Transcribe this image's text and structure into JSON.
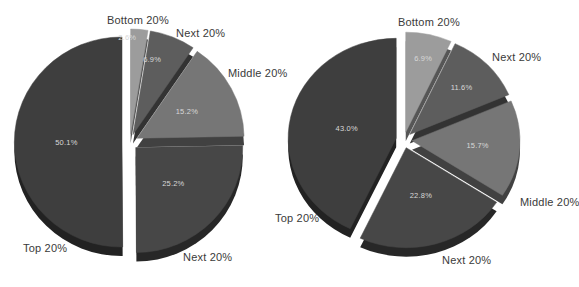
{
  "page": {
    "background_color": "#ffffff"
  },
  "styles": {
    "category_label_color": "#3a3a3a",
    "percent_label_color": "#d8d8d8",
    "slice_gap_color": "#ffffff"
  },
  "chart_data": [
    {
      "type": "pie",
      "variant": "3d-exploded",
      "position": "left",
      "title": "",
      "legend": "none",
      "labels_outside": true,
      "percent_labels_inside": true,
      "slices": [
        {
          "label": "Bottom 20%",
          "value": 2.6,
          "display": "2.6%",
          "color": "#9c9c9c"
        },
        {
          "label": "Next 20%",
          "value": 6.9,
          "display": "6.9%",
          "color": "#5d5d5d"
        },
        {
          "label": "Middle 20%",
          "value": 15.2,
          "display": "15.2%",
          "color": "#767676"
        },
        {
          "label": "Next 20%",
          "value": 25.2,
          "display": "25.2%",
          "color": "#474747"
        },
        {
          "label": "Top 20%",
          "value": 50.1,
          "display": "50.1%",
          "color": "#3e3e3e"
        }
      ]
    },
    {
      "type": "pie",
      "variant": "3d-exploded",
      "position": "right",
      "title": "",
      "legend": "none",
      "labels_outside": true,
      "percent_labels_inside": true,
      "slices": [
        {
          "label": "Bottom 20%",
          "value": 6.9,
          "display": "6.9%",
          "color": "#9c9c9c"
        },
        {
          "label": "Next 20%",
          "value": 11.6,
          "display": "11.6%",
          "color": "#5d5d5d"
        },
        {
          "label": "Middle 20%",
          "value": 15.7,
          "display": "15.7%",
          "color": "#767676"
        },
        {
          "label": "Next 20%",
          "value": 22.8,
          "display": "22.8%",
          "color": "#474747"
        },
        {
          "label": "Top 20%",
          "value": 43.0,
          "display": "43.0%",
          "color": "#3e3e3e"
        }
      ]
    }
  ]
}
